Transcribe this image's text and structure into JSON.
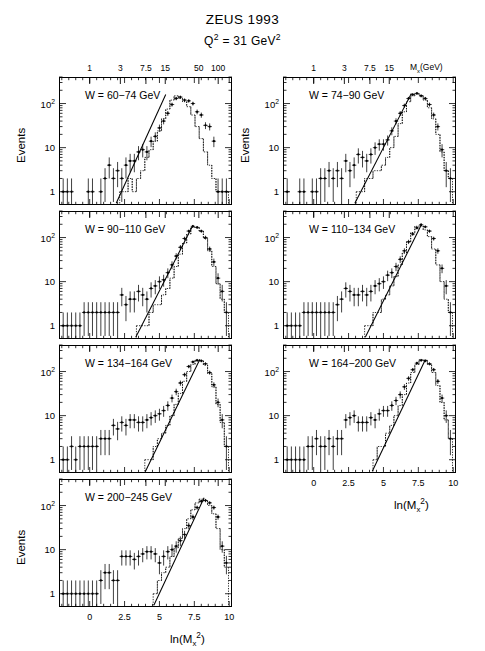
{
  "figure": {
    "title": "ZEUS 1993",
    "subtitle_prefix": "Q",
    "subtitle_sup": "2",
    "subtitle_mid": " = 31 GeV",
    "subtitle_sup2": "2",
    "subtitle_plain": "Q2 = 31 GeV2"
  },
  "axes": {
    "ylabel": "Events",
    "xlabel_main": "ln(M",
    "xlabel_sub": "x",
    "xlabel_sup": "2",
    "xlabel_close": ")",
    "xlabel_plain": "ln(Mx2)",
    "toplabel_main": "M",
    "toplabel_sub": "x",
    "toplabel_rest": "(GeV)",
    "toplabel_plain": "Mx(GeV)",
    "xticks": [
      "0",
      "2.5",
      "5",
      "7.5",
      "10"
    ],
    "xtick_values": [
      0,
      2.5,
      5,
      7.5,
      10
    ],
    "xlim": [
      -2.2,
      10.2
    ],
    "yticks": [
      "1",
      "10",
      "10"
    ],
    "ytick_sup": [
      "",
      "",
      "2"
    ],
    "ytick_values": [
      1,
      10,
      100
    ],
    "ylim": [
      0.5,
      400
    ],
    "yscale": "log",
    "top_ticks_left": [
      "1",
      "3",
      "7.5",
      "15",
      "50",
      "100"
    ],
    "top_tick_values_left": [
      1,
      3,
      7.5,
      15,
      50,
      100
    ],
    "top_ticks_right": [
      "1",
      "3",
      "7.5",
      "15"
    ],
    "top_tick_values_right": [
      1,
      3,
      7.5,
      15
    ]
  },
  "chart_data": {
    "type": "line",
    "title": "ZEUS 1993",
    "subtitle": "Q2 = 31 GeV2",
    "xlabel": "ln(Mx2)",
    "ylabel": "Events",
    "yscale": "log",
    "xlim": [
      -2.2,
      10.2
    ],
    "ylim": [
      0.5,
      400
    ],
    "grid": false,
    "legend": "none",
    "panel_layout": "2 columns x 4 rows, 7 panels (last row left only)",
    "series_description": "Per panel: 'data' = measured events with vertical error bars (points, solid markers); 'mc' = dotted Monte Carlo histogram; 'fit' = solid straight line fit on log scale",
    "panels": [
      {
        "label": "W = 60-74 GeV",
        "w_range": [
          60,
          74
        ],
        "row": 0,
        "col": 0,
        "fit_line": {
          "x0": 1.9,
          "y0": 0.55,
          "x1": 5.45,
          "y1": 160
        },
        "data": {
          "x": [
            -1.9,
            -1.6,
            -1.3,
            -1.0,
            -0.7,
            -0.4,
            -0.1,
            0.2,
            0.5,
            0.8,
            1.1,
            1.4,
            1.7,
            2.0,
            2.3,
            2.6,
            2.9,
            3.2,
            3.5,
            3.8,
            4.1,
            4.4,
            4.7,
            5.0,
            5.3,
            5.6,
            5.9,
            6.2,
            6.5,
            6.8,
            7.1,
            7.4,
            7.7,
            8.0,
            8.3,
            8.6,
            8.9,
            9.2,
            9.5,
            9.8
          ],
          "y": [
            1,
            1,
            1,
            null,
            null,
            null,
            1,
            1,
            null,
            1,
            2,
            4,
            2,
            3,
            2,
            4,
            5,
            5,
            8,
            9,
            8,
            14,
            18,
            28,
            40,
            60,
            95,
            130,
            140,
            120,
            115,
            100,
            65,
            55,
            32,
            30,
            14,
            1,
            1,
            1
          ],
          "yerr_rel": 0.45
        },
        "mc": {
          "x": [
            2.3,
            2.6,
            2.9,
            3.2,
            3.5,
            3.8,
            4.1,
            4.4,
            4.7,
            5.0,
            5.3,
            5.6,
            5.9,
            6.2,
            6.5,
            6.8,
            7.1,
            7.4,
            7.7,
            8.0,
            8.3,
            8.6,
            8.9,
            9.2,
            9.5,
            9.8
          ],
          "y": [
            1,
            1,
            2,
            1,
            2,
            3,
            6,
            9,
            14,
            24,
            45,
            75,
            120,
            150,
            130,
            110,
            85,
            55,
            30,
            16,
            8,
            4,
            2,
            1,
            1,
            1
          ]
        }
      },
      {
        "label": "W = 74-90 GeV",
        "w_range": [
          74,
          90
        ],
        "row": 0,
        "col": 1,
        "fit_line": {
          "x0": 2.95,
          "y0": 0.55,
          "x1": 7.0,
          "y1": 170
        },
        "data": {
          "x": [
            -1.9,
            -1.6,
            -1.3,
            -1.0,
            -0.7,
            -0.4,
            -0.1,
            0.2,
            0.5,
            0.8,
            1.1,
            1.4,
            1.7,
            2.0,
            2.3,
            2.6,
            2.9,
            3.2,
            3.5,
            3.8,
            4.1,
            4.4,
            4.7,
            5.0,
            5.3,
            5.6,
            5.9,
            6.2,
            6.5,
            6.8,
            7.1,
            7.4,
            7.7,
            8.0,
            8.3,
            8.6,
            8.9,
            9.2,
            9.5,
            9.8
          ],
          "y": [
            1,
            null,
            null,
            1,
            1,
            null,
            1,
            1,
            2,
            2,
            3,
            2,
            3,
            2,
            5,
            3,
            4,
            7,
            6,
            5,
            7,
            10,
            12,
            12,
            15,
            24,
            40,
            60,
            90,
            130,
            160,
            170,
            150,
            130,
            95,
            55,
            30,
            9,
            3,
            2
          ],
          "yerr_rel": 0.45
        },
        "mc": {
          "x": [
            3.2,
            3.5,
            3.8,
            4.1,
            4.4,
            4.7,
            5.0,
            5.3,
            5.6,
            5.9,
            6.2,
            6.5,
            6.8,
            7.1,
            7.4,
            7.7,
            8.0,
            8.3,
            8.6,
            8.9,
            9.2,
            9.5,
            9.8
          ],
          "y": [
            1,
            1,
            2,
            2,
            3,
            3,
            4,
            6,
            10,
            18,
            35,
            65,
            110,
            150,
            170,
            150,
            120,
            80,
            45,
            20,
            8,
            3,
            2
          ]
        }
      },
      {
        "label": "W = 90-110 GeV",
        "w_range": [
          90,
          110
        ],
        "row": 1,
        "col": 0,
        "fit_line": {
          "x0": 3.3,
          "y0": 0.55,
          "x1": 7.4,
          "y1": 190
        },
        "data": {
          "x": [
            -1.9,
            -1.6,
            -1.3,
            -1.0,
            -0.7,
            -0.4,
            -0.1,
            0.2,
            0.5,
            0.8,
            1.1,
            1.4,
            1.7,
            2.0,
            2.3,
            2.6,
            2.9,
            3.2,
            3.5,
            3.8,
            4.1,
            4.4,
            4.7,
            5.0,
            5.3,
            5.6,
            5.9,
            6.2,
            6.5,
            6.8,
            7.1,
            7.4,
            7.7,
            8.0,
            8.3,
            8.6,
            8.9,
            9.2,
            9.5,
            9.8
          ],
          "y": [
            1,
            1,
            1,
            1,
            1,
            2,
            2,
            2,
            2,
            2,
            2,
            2,
            2,
            2,
            5,
            3,
            4,
            4,
            6,
            5,
            4,
            7,
            8,
            10,
            11,
            16,
            24,
            38,
            60,
            95,
            140,
            180,
            170,
            140,
            100,
            55,
            28,
            12,
            6,
            2
          ],
          "yerr_rel": 0.45
        },
        "mc": {
          "x": [
            3.5,
            3.8,
            4.1,
            4.4,
            4.7,
            5.0,
            5.3,
            5.6,
            5.9,
            6.2,
            6.5,
            6.8,
            7.1,
            7.4,
            7.7,
            8.0,
            8.3,
            8.6,
            8.9,
            9.2,
            9.5,
            9.8
          ],
          "y": [
            1,
            1,
            1,
            2,
            3,
            3,
            5,
            7,
            12,
            22,
            42,
            75,
            120,
            170,
            170,
            140,
            95,
            50,
            22,
            9,
            4,
            2
          ]
        }
      },
      {
        "label": "W = 110-134 GeV",
        "w_range": [
          110,
          134
        ],
        "row": 1,
        "col": 1,
        "fit_line": {
          "x0": 3.7,
          "y0": 0.55,
          "x1": 7.7,
          "y1": 190
        },
        "data": {
          "x": [
            -1.9,
            -1.6,
            -1.3,
            -1.0,
            -0.7,
            -0.4,
            -0.1,
            0.2,
            0.5,
            0.8,
            1.1,
            1.4,
            1.7,
            2.0,
            2.3,
            2.6,
            2.9,
            3.2,
            3.5,
            3.8,
            4.1,
            4.4,
            4.7,
            5.0,
            5.3,
            5.6,
            5.9,
            6.2,
            6.5,
            6.8,
            7.1,
            7.4,
            7.7,
            8.0,
            8.3,
            8.6,
            8.9,
            9.2,
            9.5,
            9.8
          ],
          "y": [
            1,
            1,
            1,
            1,
            2,
            2,
            2,
            2,
            2,
            2,
            2,
            2,
            3,
            4,
            7,
            6,
            5,
            5,
            6,
            5,
            6,
            8,
            9,
            10,
            14,
            16,
            22,
            32,
            50,
            80,
            120,
            165,
            195,
            175,
            140,
            95,
            50,
            20,
            8,
            2
          ],
          "yerr_rel": 0.45
        },
        "mc": {
          "x": [
            3.8,
            4.1,
            4.4,
            4.7,
            5.0,
            5.3,
            5.6,
            5.9,
            6.2,
            6.5,
            6.8,
            7.1,
            7.4,
            7.7,
            8.0,
            8.3,
            8.6,
            8.9,
            9.2,
            9.5,
            9.8
          ],
          "y": [
            1,
            1,
            2,
            2,
            4,
            5,
            8,
            13,
            24,
            45,
            80,
            130,
            180,
            185,
            150,
            105,
            55,
            24,
            10,
            4,
            2
          ]
        }
      },
      {
        "label": "W = 134-164 GeV",
        "w_range": [
          134,
          164
        ],
        "row": 2,
        "col": 0,
        "fit_line": {
          "x0": 4.0,
          "y0": 0.55,
          "x1": 7.9,
          "y1": 190
        },
        "data": {
          "x": [
            -1.9,
            -1.6,
            -1.3,
            -1.0,
            -0.7,
            -0.4,
            -0.1,
            0.2,
            0.5,
            0.8,
            1.1,
            1.4,
            1.7,
            2.0,
            2.3,
            2.6,
            2.9,
            3.2,
            3.5,
            3.8,
            4.1,
            4.4,
            4.7,
            5.0,
            5.3,
            5.6,
            5.9,
            6.2,
            6.5,
            6.8,
            7.1,
            7.4,
            7.7,
            8.0,
            8.3,
            8.6,
            8.9,
            9.2,
            9.5,
            9.8
          ],
          "y": [
            1,
            1,
            2,
            1,
            2,
            2,
            2,
            2,
            2,
            3,
            3,
            3,
            6,
            5,
            7,
            6,
            8,
            8,
            7,
            7,
            8,
            9,
            10,
            11,
            13,
            17,
            25,
            35,
            55,
            85,
            130,
            165,
            180,
            175,
            150,
            95,
            50,
            20,
            8,
            2
          ],
          "yerr_rel": 0.45
        },
        "mc": {
          "x": [
            4.1,
            4.4,
            4.7,
            5.0,
            5.3,
            5.6,
            5.9,
            6.2,
            6.5,
            6.8,
            7.1,
            7.4,
            7.7,
            8.0,
            8.3,
            8.6,
            8.9,
            9.2,
            9.5,
            9.8
          ],
          "y": [
            1,
            1,
            2,
            3,
            4,
            6,
            10,
            18,
            32,
            60,
            100,
            145,
            180,
            175,
            140,
            90,
            45,
            18,
            7,
            2
          ]
        }
      },
      {
        "label": "W = 164-200 GeV",
        "w_range": [
          164,
          200
        ],
        "row": 2,
        "col": 1,
        "fit_line": {
          "x0": 4.2,
          "y0": 0.55,
          "x1": 8.0,
          "y1": 185
        },
        "data": {
          "x": [
            -1.9,
            -1.6,
            -1.3,
            -1.0,
            -0.7,
            -0.4,
            -0.1,
            0.2,
            0.5,
            0.8,
            1.1,
            1.4,
            1.7,
            2.0,
            2.3,
            2.6,
            2.9,
            3.2,
            3.5,
            3.8,
            4.1,
            4.4,
            4.7,
            5.0,
            5.3,
            5.6,
            5.9,
            6.2,
            6.5,
            6.8,
            7.1,
            7.4,
            7.7,
            8.0,
            8.3,
            8.6,
            8.9,
            9.2,
            9.5,
            9.8
          ],
          "y": [
            1,
            1,
            1,
            1,
            1,
            2,
            2,
            3,
            2,
            2,
            3,
            2,
            3,
            3,
            8,
            9,
            10,
            7,
            7,
            7,
            9,
            8,
            11,
            13,
            13,
            17,
            22,
            30,
            45,
            70,
            110,
            155,
            180,
            175,
            150,
            110,
            60,
            25,
            10,
            3
          ],
          "yerr_rel": 0.45
        },
        "mc": {
          "x": [
            4.4,
            4.7,
            5.0,
            5.3,
            5.6,
            5.9,
            6.2,
            6.5,
            6.8,
            7.1,
            7.4,
            7.7,
            8.0,
            8.3,
            8.6,
            8.9,
            9.2,
            9.5,
            9.8
          ],
          "y": [
            1,
            2,
            2,
            4,
            6,
            10,
            17,
            30,
            55,
            95,
            145,
            185,
            180,
            145,
            95,
            48,
            20,
            8,
            3
          ]
        }
      },
      {
        "label": "W = 200-245 GeV",
        "w_range": [
          200,
          245
        ],
        "row": 3,
        "col": 0,
        "fit_line": {
          "x0": 4.6,
          "y0": 0.55,
          "x1": 8.2,
          "y1": 150
        },
        "data": {
          "x": [
            -1.9,
            -1.6,
            -1.3,
            -1.0,
            -0.7,
            -0.4,
            -0.1,
            0.2,
            0.5,
            0.8,
            1.1,
            1.4,
            1.7,
            2.0,
            2.3,
            2.6,
            2.9,
            3.2,
            3.5,
            3.8,
            4.1,
            4.4,
            4.7,
            5.0,
            5.3,
            5.6,
            5.9,
            6.2,
            6.5,
            6.8,
            7.1,
            7.4,
            7.7,
            8.0,
            8.3,
            8.6,
            8.9,
            9.2,
            9.5,
            9.8
          ],
          "y": [
            1,
            1,
            1,
            1,
            1,
            1,
            1,
            1,
            1,
            2,
            3,
            3,
            2,
            2,
            7,
            7,
            7,
            6,
            7,
            8,
            9,
            9,
            8,
            5,
            7,
            9,
            10,
            12,
            16,
            22,
            35,
            55,
            90,
            125,
            130,
            115,
            90,
            55,
            12,
            5
          ],
          "yerr_rel": 0.45
        },
        "mc": {
          "x": [
            4.7,
            5.0,
            5.3,
            5.6,
            5.9,
            6.2,
            6.5,
            6.8,
            7.1,
            7.4,
            7.7,
            8.0,
            8.3,
            8.6,
            8.9,
            9.2,
            9.5,
            9.8
          ],
          "y": [
            1,
            2,
            3,
            4,
            7,
            11,
            18,
            30,
            50,
            80,
            115,
            140,
            130,
            100,
            65,
            30,
            10,
            4
          ]
        }
      }
    ]
  }
}
